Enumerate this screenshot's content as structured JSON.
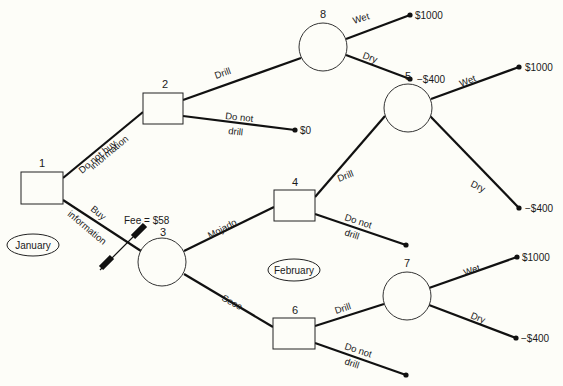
{
  "nodes": {
    "n1": {
      "label": "1",
      "type": "decision"
    },
    "n2": {
      "label": "2",
      "type": "decision"
    },
    "n3": {
      "label": "3",
      "type": "chance"
    },
    "n4": {
      "label": "4",
      "type": "decision"
    },
    "n5": {
      "label": "5",
      "type": "chance"
    },
    "n6": {
      "label": "6",
      "type": "decision"
    },
    "n7": {
      "label": "7",
      "type": "chance"
    },
    "n8": {
      "label": "8",
      "type": "chance"
    }
  },
  "edges": {
    "do_not_buy_1": "Do not buy",
    "do_not_buy_2": "information",
    "buy_1": "Buy",
    "buy_2": "information",
    "n2_drill": "Drill",
    "n2_donot_1": "Do not",
    "n2_donot_2": "drill",
    "n8_wet": "Wet",
    "n8_dry": "Dry",
    "mojado": "Mojado",
    "seco": "Seco",
    "n4_drill": "Drill",
    "n4_donot_1": "Do not",
    "n4_donot_2": "drill",
    "n5_wet": "Wet",
    "n5_dry": "Dry",
    "n6_drill": "Drill",
    "n6_donot_1": "Do not",
    "n6_donot_2": "drill",
    "n7_wet": "Wet",
    "n7_dry": "Dry"
  },
  "payoffs": {
    "n8_wet": "$1000",
    "n8_dry": "−$400",
    "n2_donot": "$0",
    "n5_wet": "$1000",
    "n5_dry": "−$400",
    "n7_wet": "$1000",
    "n7_dry": "−$400"
  },
  "fee": "Fee = $58",
  "periods": {
    "january": "January",
    "february": "February"
  },
  "colors": {
    "line": "#111111",
    "background": "#fdfdf8"
  }
}
